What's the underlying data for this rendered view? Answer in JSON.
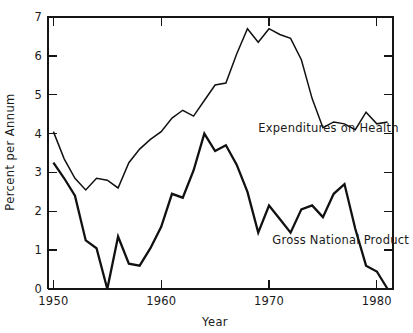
{
  "chart_data": {
    "type": "line",
    "title": "",
    "xlabel": "Year",
    "ylabel": "Percent per Annum",
    "xlim": [
      1949.5,
      1981.5
    ],
    "ylim": [
      0,
      7
    ],
    "xticks": [
      1950,
      1960,
      1970,
      1980
    ],
    "xtick_labels": [
      "1950",
      "1960",
      "1970",
      "1980"
    ],
    "yticks": [
      0,
      1,
      2,
      3,
      4,
      5,
      6,
      7
    ],
    "ytick_labels": [
      "0",
      "1",
      "2",
      "3",
      "4",
      "5",
      "6",
      "7"
    ],
    "grid": false,
    "legend_position": "inline-annotation",
    "series": [
      {
        "name": "Expenditures on Health",
        "label_x": 1969.0,
        "label_y": 4.05,
        "stroke": "#111111",
        "x": [
          1950,
          1951,
          1952,
          1953,
          1954,
          1955,
          1956,
          1957,
          1958,
          1959,
          1960,
          1961,
          1962,
          1963,
          1964,
          1965,
          1966,
          1967,
          1968,
          1969,
          1970,
          1971,
          1972,
          1973,
          1974,
          1975,
          1976,
          1977,
          1978,
          1979,
          1980,
          1981
        ],
        "y": [
          4.05,
          3.35,
          2.85,
          2.55,
          2.85,
          2.8,
          2.6,
          3.25,
          3.6,
          3.85,
          4.05,
          4.4,
          4.6,
          4.45,
          4.85,
          5.25,
          5.3,
          6.05,
          6.7,
          6.35,
          6.7,
          6.55,
          6.45,
          5.9,
          4.9,
          4.15,
          4.3,
          4.25,
          4.1,
          4.55,
          4.25,
          4.3
        ],
        "annotations": []
      },
      {
        "name": "Gross National Product",
        "label_x": 1970.3,
        "label_y": 1.15,
        "stroke": "#111111",
        "x": [
          1950,
          1951,
          1952,
          1953,
          1954,
          1955,
          1956,
          1957,
          1958,
          1959,
          1960,
          1961,
          1962,
          1963,
          1964,
          1965,
          1966,
          1967,
          1968,
          1969,
          1970,
          1971,
          1972,
          1973,
          1974,
          1975,
          1976,
          1977,
          1978,
          1979,
          1980,
          1981
        ],
        "y": [
          3.25,
          2.85,
          2.4,
          1.25,
          1.05,
          0.0,
          1.35,
          0.65,
          0.6,
          1.05,
          1.6,
          2.45,
          2.35,
          3.05,
          4.0,
          3.55,
          3.7,
          3.2,
          2.5,
          1.45,
          2.15,
          1.8,
          1.45,
          2.05,
          2.15,
          1.85,
          2.45,
          2.7,
          1.55,
          0.6,
          0.45,
          0.0
        ],
        "annotations": []
      }
    ]
  },
  "labels": {
    "series_health": "Expenditures on Health",
    "series_gnp": "Gross National Product",
    "x_axis_title": "Year",
    "y_axis_title": "Percent per Annum"
  }
}
